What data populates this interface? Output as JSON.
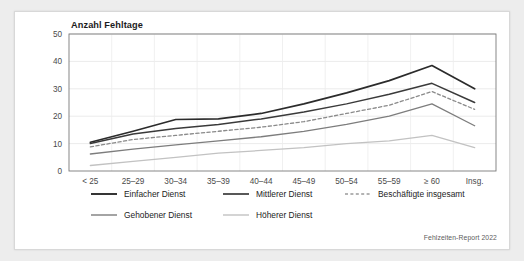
{
  "card": {
    "title": "Anzahl Fehltage",
    "source": "Fehlzeiten-Report 2022"
  },
  "chart_data": {
    "type": "line",
    "title": "Anzahl Fehltage",
    "xlabel": "",
    "ylabel": "Anzahl Fehltage",
    "ylim": [
      0,
      50
    ],
    "yticks": [
      0,
      10,
      20,
      30,
      40,
      50
    ],
    "grid": true,
    "legend_position": "bottom",
    "categories": [
      "< 25",
      "25–29",
      "30–34",
      "35–39",
      "40–44",
      "45–49",
      "50–54",
      "55–59",
      "≥ 60",
      "Insg."
    ],
    "series": [
      {
        "name": "Einfacher Dienst",
        "style": "solid",
        "color": "#2b2b2b",
        "width": 1.7,
        "values": [
          10.5,
          14.5,
          18.8,
          19.0,
          21.0,
          24.5,
          28.5,
          33.0,
          38.5,
          30.0
        ]
      },
      {
        "name": "Mittlerer Dienst",
        "style": "solid",
        "color": "#3a3a3a",
        "width": 1.5,
        "values": [
          10.0,
          13.5,
          15.5,
          17.0,
          19.0,
          21.5,
          24.5,
          28.0,
          32.0,
          25.0
        ]
      },
      {
        "name": "Beschäftigte insgesamt",
        "style": "dashed",
        "color": "#8a8a8a",
        "width": 1.3,
        "values": [
          8.8,
          11.5,
          13.0,
          14.5,
          16.0,
          18.0,
          21.0,
          24.0,
          29.0,
          22.5
        ]
      },
      {
        "name": "Gehobener Dienst",
        "style": "solid",
        "color": "#7d7d7d",
        "width": 1.3,
        "values": [
          6.2,
          8.0,
          9.5,
          11.0,
          12.5,
          14.5,
          17.0,
          20.0,
          24.5,
          16.5
        ]
      },
      {
        "name": "Höherer Dienst",
        "style": "solid",
        "color": "#c2c2c2",
        "width": 1.3,
        "values": [
          2.0,
          3.5,
          5.0,
          6.5,
          7.5,
          8.5,
          10.0,
          11.0,
          13.0,
          8.5
        ]
      }
    ]
  },
  "legend": [
    {
      "label": "Einfacher Dienst",
      "color": "#2b2b2b",
      "style": "solid",
      "width": 1.9
    },
    {
      "label": "Mittlerer Dienst",
      "color": "#3a3a3a",
      "style": "solid",
      "width": 1.7
    },
    {
      "label": "Beschäftigte insgesamt",
      "color": "#9a9a9a",
      "style": "dashed",
      "width": 1.3
    },
    {
      "label": "Gehobener Dienst",
      "color": "#7d7d7d",
      "style": "solid",
      "width": 1.4
    },
    {
      "label": "Höherer Dienst",
      "color": "#c2c2c2",
      "style": "solid",
      "width": 1.4
    }
  ]
}
